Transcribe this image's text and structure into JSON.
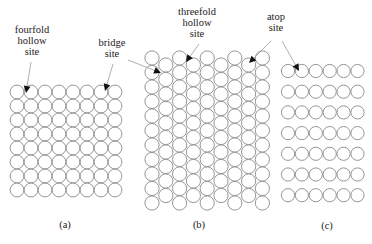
{
  "figure": {
    "colors": {
      "background": "#ffffff",
      "atom_stroke": "#8a8a8a",
      "atom_fill": "#ffffff",
      "text": "#222222",
      "arrow_head": "#111111",
      "leader_line": "#9a9a9a"
    }
  },
  "annotations": [
    {
      "id": "fourfold",
      "lines": [
        "fourfold",
        "hollow",
        "site"
      ],
      "x": 32,
      "y": [
        33,
        44,
        55
      ]
    },
    {
      "id": "bridge",
      "lines": [
        "bridge",
        "site"
      ],
      "x": 112,
      "y": [
        46,
        57
      ]
    },
    {
      "id": "threefold",
      "lines": [
        "threefold",
        "hollow",
        "site"
      ],
      "x": 197,
      "y": [
        15,
        26,
        37
      ]
    },
    {
      "id": "atop",
      "lines": [
        "atop",
        "site"
      ],
      "x": 276,
      "y": [
        20,
        31
      ]
    }
  ],
  "arrows": [
    {
      "from": "fourfold",
      "x1": 31,
      "y1": 62,
      "x2": 26,
      "y2": 93
    },
    {
      "from": "bridge",
      "x1": 113,
      "y1": 64,
      "x2": 105,
      "y2": 91
    },
    {
      "from": "bridge",
      "x1": 128,
      "y1": 60,
      "x2": 161,
      "y2": 73
    },
    {
      "from": "threefold",
      "x1": 199,
      "y1": 44,
      "x2": 186,
      "y2": 62
    },
    {
      "from": "atop",
      "x1": 271,
      "y1": 41,
      "x2": 249,
      "y2": 63
    },
    {
      "from": "atop",
      "x1": 282,
      "y1": 41,
      "x2": 299,
      "y2": 71
    }
  ],
  "panels": [
    {
      "id": "a",
      "caption": "(a)",
      "caption_x": 65,
      "caption_y": 228,
      "lattice": "square",
      "cols": 8,
      "rows": 8,
      "x0": 17,
      "y0": 92,
      "dx": 14,
      "dy": 14,
      "r": 6.9
    },
    {
      "id": "b",
      "caption": "(b)",
      "caption_x": 199,
      "caption_y": 228,
      "lattice": "hexagonal",
      "cols": 9,
      "x0": 152,
      "dx": 13.8,
      "dy": 14.5,
      "r": 7.1,
      "even_col_y0": 58,
      "even_col_count": 11,
      "odd_col_y0": 65,
      "odd_col_count": 10
    },
    {
      "id": "c",
      "caption": "(c)",
      "caption_x": 327,
      "caption_y": 229,
      "lattice": "rows",
      "cols": 6,
      "rows": 7,
      "x0": 288,
      "y0": 71,
      "dx": 13.9,
      "dy": 20.7,
      "r": 6.6
    }
  ]
}
